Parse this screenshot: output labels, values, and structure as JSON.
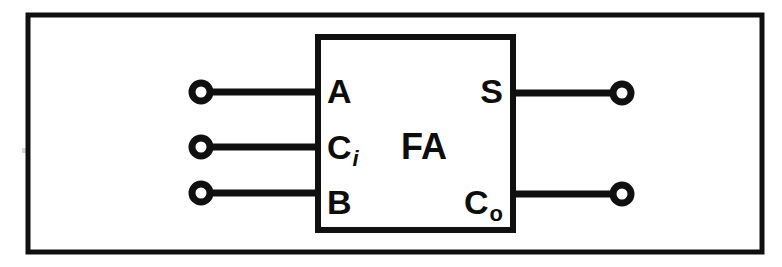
{
  "figure": {
    "kind": "block-diagram",
    "background_color": "#ffffff",
    "ink_color": "#101010"
  },
  "frame": {
    "name": "outer-border",
    "x": 28,
    "y": 15,
    "width": 734,
    "height": 237
  },
  "block": {
    "label": "FA",
    "x": 318,
    "y": 37,
    "width": 195,
    "height": 193,
    "label_x": 424,
    "label_y": 159
  },
  "inputs": [
    {
      "id": "input-a",
      "label": "A",
      "sub": "",
      "sub_italic": false,
      "wire_y": 92,
      "terminal_x": 201,
      "label_x": 327,
      "label_y": 103
    },
    {
      "id": "input-ci",
      "label": "C",
      "sub": "i",
      "sub_italic": true,
      "wire_y": 147,
      "terminal_x": 201,
      "label_x": 327,
      "label_y": 159
    },
    {
      "id": "input-b",
      "label": "B",
      "sub": "",
      "sub_italic": false,
      "wire_y": 193,
      "terminal_x": 201,
      "label_x": 327,
      "label_y": 214
    }
  ],
  "outputs": [
    {
      "id": "output-s",
      "label": "S",
      "sub": "",
      "sub_italic": false,
      "wire_y": 93,
      "terminal_x": 622,
      "label_x": 503,
      "label_y": 103
    },
    {
      "id": "output-co",
      "label": "C",
      "sub": "o",
      "sub_italic": false,
      "wire_y": 194,
      "terminal_x": 622,
      "label_x": 503,
      "label_y": 214
    }
  ],
  "terminal": {
    "radius": 9
  }
}
